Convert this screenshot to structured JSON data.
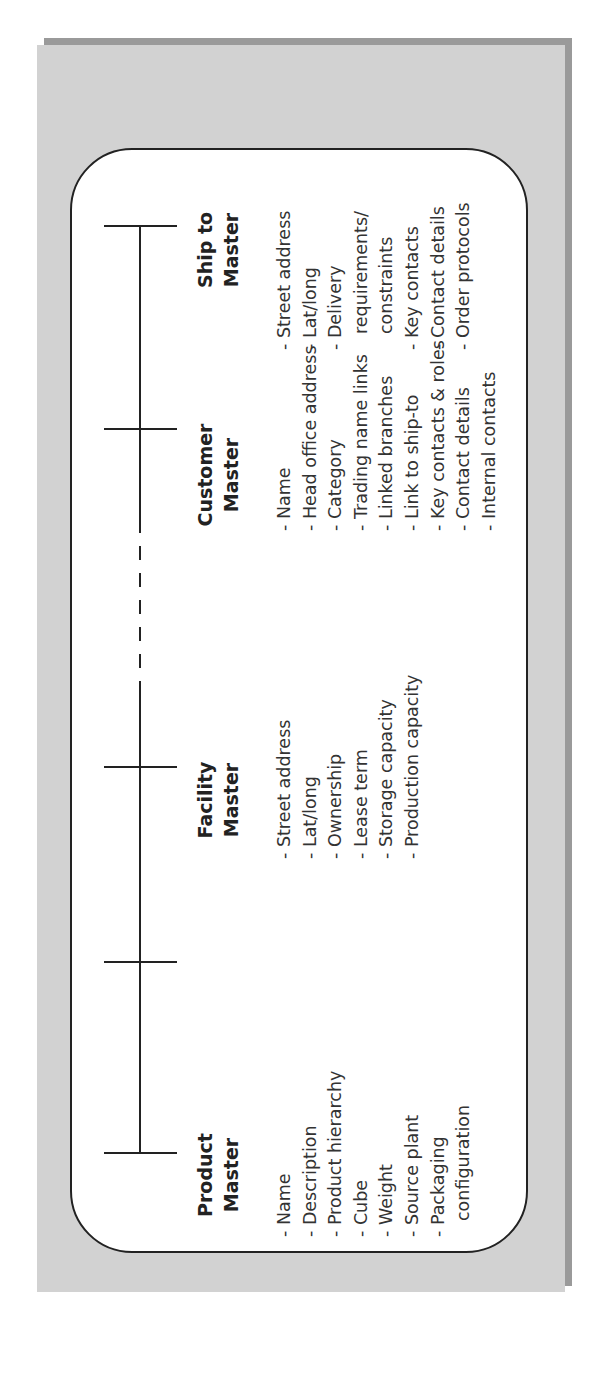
{
  "diagram": {
    "colors": {
      "panel": "#d2d2d2",
      "shadow": "#9a9a9a",
      "box": "#ffffff",
      "line": "#222222"
    },
    "orientation": "rotated -90deg",
    "axis": {
      "note": "Timeline connecting master data entities; dashed segment between Facility and Customer"
    },
    "columns": [
      {
        "id": "product",
        "title_line1": "Product",
        "title_line2": "Master",
        "items": [
          "- Name",
          "- Description",
          "- Product hierarchy",
          "- Cube",
          "- Weight",
          "- Source plant",
          "- Packaging",
          "configuration"
        ]
      },
      {
        "id": "facility",
        "title_line1": "Facility",
        "title_line2": "Master",
        "items": [
          "- Street address",
          "- Lat/long",
          "- Ownership",
          "- Lease term",
          "- Storage capacity",
          "- Production capacity"
        ]
      },
      {
        "id": "customer",
        "title_line1": "Customer",
        "title_line2": "Master",
        "items": [
          "- Name",
          "- Head office address",
          "- Category",
          "- Trading name links",
          "- Linked branches",
          "- Link to ship-to",
          "- Key contacts & roles",
          "- Contact details",
          "- Internal contacts"
        ]
      },
      {
        "id": "shipto",
        "title_line1": "Ship to",
        "title_line2": "Master",
        "items": [
          "- Street address",
          "- Lat/long",
          "- Delivery",
          "requirements/",
          "constraints",
          "- Key contacts",
          "- Contact details",
          "- Order protocols"
        ]
      }
    ]
  }
}
